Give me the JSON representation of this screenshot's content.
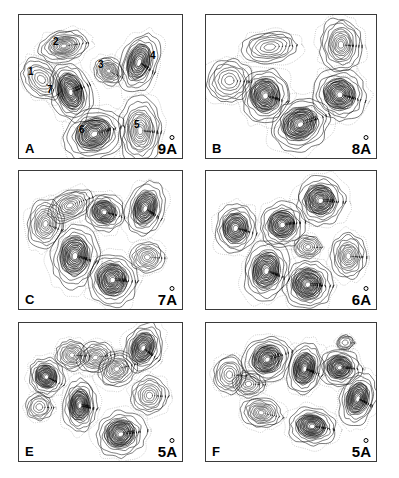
{
  "figure": {
    "background_color": "#ffffff",
    "contour_color": "#000000",
    "panel_border_color": "#3a3a3a"
  },
  "panels": [
    {
      "id": "A",
      "letter": "A",
      "resolution": "9",
      "unit": "A",
      "feature_labels": [
        {
          "text": "1",
          "x": 9,
          "y": 52
        },
        {
          "text": "2",
          "x": 34,
          "y": 22
        },
        {
          "text": "3",
          "x": 79,
          "y": 45
        },
        {
          "text": "4",
          "x": 131,
          "y": 36
        },
        {
          "text": "5",
          "x": 115,
          "y": 105
        },
        {
          "text": "6",
          "x": 60,
          "y": 110
        },
        {
          "text": "7",
          "x": 28,
          "y": 70
        }
      ]
    },
    {
      "id": "B",
      "letter": "B",
      "resolution": "8",
      "unit": "A",
      "feature_labels": []
    },
    {
      "id": "C",
      "letter": "C",
      "resolution": "7",
      "unit": "A",
      "feature_labels": []
    },
    {
      "id": "D",
      "letter": "",
      "resolution": "6",
      "unit": "A",
      "feature_labels": []
    },
    {
      "id": "E",
      "letter": "E",
      "resolution": "5",
      "unit": "A",
      "feature_labels": []
    },
    {
      "id": "F",
      "letter": "F",
      "resolution": "5",
      "unit": "A",
      "feature_labels": []
    }
  ],
  "chart_data": {
    "type": "contour",
    "title": "",
    "xlabel": "",
    "ylabel": "",
    "grid": false,
    "legend": "none",
    "series": [
      {
        "name": "A",
        "resolution_angstrom": 9,
        "peaks": [
          {
            "label": "1",
            "cx": 22,
            "cy": 54,
            "rx": 13,
            "ry": 9,
            "rot": 35,
            "levels": 4,
            "intensity": "low"
          },
          {
            "label": "2",
            "cx": 44,
            "cy": 26,
            "rx": 15,
            "ry": 8,
            "rot": -8,
            "levels": 9,
            "intensity": "medium"
          },
          {
            "label": "3",
            "cx": 88,
            "cy": 47,
            "rx": 9,
            "ry": 7,
            "rot": 20,
            "levels": 7,
            "intensity": "medium"
          },
          {
            "label": "4",
            "cx": 118,
            "cy": 40,
            "rx": 11,
            "ry": 16,
            "rot": 25,
            "levels": 8,
            "intensity": "high"
          },
          {
            "label": "5",
            "cx": 119,
            "cy": 97,
            "rx": 13,
            "ry": 17,
            "rot": 0,
            "levels": 9,
            "intensity": "medium"
          },
          {
            "label": "6",
            "cx": 74,
            "cy": 100,
            "rx": 18,
            "ry": 13,
            "rot": -15,
            "levels": 10,
            "intensity": "high"
          },
          {
            "label": "7",
            "cx": 51,
            "cy": 65,
            "rx": 12,
            "ry": 16,
            "rot": -25,
            "levels": 11,
            "intensity": "very-high"
          }
        ]
      },
      {
        "name": "B",
        "resolution_angstrom": 8,
        "peaks": [
          {
            "cx": 22,
            "cy": 55,
            "rx": 13,
            "ry": 11,
            "rot": 0,
            "levels": 4,
            "intensity": "low"
          },
          {
            "cx": 60,
            "cy": 27,
            "rx": 16,
            "ry": 8,
            "rot": -5,
            "levels": 4,
            "intensity": "low"
          },
          {
            "cx": 56,
            "cy": 68,
            "rx": 14,
            "ry": 14,
            "rot": 10,
            "levels": 10,
            "intensity": "high"
          },
          {
            "cx": 89,
            "cy": 92,
            "rx": 17,
            "ry": 13,
            "rot": -20,
            "levels": 11,
            "intensity": "very-high"
          },
          {
            "cx": 127,
            "cy": 25,
            "rx": 12,
            "ry": 14,
            "rot": 0,
            "levels": 8,
            "intensity": "medium"
          },
          {
            "cx": 126,
            "cy": 67,
            "rx": 15,
            "ry": 13,
            "rot": 10,
            "levels": 10,
            "intensity": "high"
          }
        ]
      },
      {
        "name": "C",
        "resolution_angstrom": 7,
        "peaks": [
          {
            "cx": 26,
            "cy": 46,
            "rx": 11,
            "ry": 13,
            "rot": 15,
            "levels": 7,
            "intensity": "medium"
          },
          {
            "cx": 50,
            "cy": 30,
            "rx": 14,
            "ry": 8,
            "rot": -20,
            "levels": 6,
            "intensity": "medium"
          },
          {
            "cx": 84,
            "cy": 36,
            "rx": 12,
            "ry": 10,
            "rot": 10,
            "levels": 8,
            "intensity": "high"
          },
          {
            "cx": 124,
            "cy": 33,
            "rx": 11,
            "ry": 15,
            "rot": 25,
            "levels": 9,
            "intensity": "high"
          },
          {
            "cx": 55,
            "cy": 74,
            "rx": 14,
            "ry": 17,
            "rot": 10,
            "levels": 10,
            "intensity": "high"
          },
          {
            "cx": 92,
            "cy": 95,
            "rx": 15,
            "ry": 14,
            "rot": 0,
            "levels": 11,
            "intensity": "very-high"
          },
          {
            "cx": 126,
            "cy": 75,
            "rx": 10,
            "ry": 8,
            "rot": 0,
            "levels": 5,
            "intensity": "low"
          }
        ]
      },
      {
        "name": "D",
        "resolution_angstrom": 6,
        "peaks": [
          {
            "cx": 28,
            "cy": 50,
            "rx": 12,
            "ry": 13,
            "rot": 10,
            "levels": 8,
            "intensity": "high"
          },
          {
            "cx": 72,
            "cy": 47,
            "rx": 13,
            "ry": 12,
            "rot": -10,
            "levels": 9,
            "intensity": "high"
          },
          {
            "cx": 108,
            "cy": 26,
            "rx": 14,
            "ry": 13,
            "rot": 0,
            "levels": 10,
            "intensity": "very-high"
          },
          {
            "cx": 96,
            "cy": 66,
            "rx": 8,
            "ry": 6,
            "rot": 0,
            "levels": 4,
            "intensity": "low"
          },
          {
            "cx": 134,
            "cy": 74,
            "rx": 10,
            "ry": 12,
            "rot": 0,
            "levels": 7,
            "intensity": "medium"
          },
          {
            "cx": 57,
            "cy": 87,
            "rx": 13,
            "ry": 16,
            "rot": 15,
            "levels": 10,
            "intensity": "high"
          },
          {
            "cx": 96,
            "cy": 99,
            "rx": 14,
            "ry": 13,
            "rot": 0,
            "levels": 11,
            "intensity": "very-high"
          }
        ]
      },
      {
        "name": "E",
        "resolution_angstrom": 5,
        "peaks": [
          {
            "cx": 27,
            "cy": 47,
            "rx": 11,
            "ry": 10,
            "rot": 20,
            "levels": 9,
            "intensity": "high"
          },
          {
            "cx": 52,
            "cy": 28,
            "rx": 10,
            "ry": 8,
            "rot": 0,
            "levels": 6,
            "intensity": "medium"
          },
          {
            "cx": 75,
            "cy": 30,
            "rx": 11,
            "ry": 8,
            "rot": -10,
            "levels": 6,
            "intensity": "medium"
          },
          {
            "cx": 96,
            "cy": 40,
            "rx": 12,
            "ry": 9,
            "rot": -15,
            "levels": 7,
            "intensity": "medium"
          },
          {
            "cx": 122,
            "cy": 22,
            "rx": 11,
            "ry": 14,
            "rot": 30,
            "levels": 9,
            "intensity": "high"
          },
          {
            "cx": 128,
            "cy": 63,
            "rx": 11,
            "ry": 10,
            "rot": 0,
            "levels": 5,
            "intensity": "low"
          },
          {
            "cx": 60,
            "cy": 72,
            "rx": 10,
            "ry": 14,
            "rot": 5,
            "levels": 10,
            "intensity": "very-high"
          },
          {
            "cx": 100,
            "cy": 97,
            "rx": 15,
            "ry": 12,
            "rot": -10,
            "levels": 10,
            "intensity": "very-high"
          },
          {
            "cx": 20,
            "cy": 73,
            "rx": 8,
            "ry": 7,
            "rot": 0,
            "levels": 3,
            "intensity": "low"
          }
        ]
      },
      {
        "name": "F",
        "resolution_angstrom": 5,
        "peaks": [
          {
            "cx": 22,
            "cy": 45,
            "rx": 9,
            "ry": 10,
            "rot": 0,
            "levels": 4,
            "intensity": "low"
          },
          {
            "cx": 40,
            "cy": 53,
            "rx": 9,
            "ry": 7,
            "rot": 0,
            "levels": 4,
            "intensity": "low"
          },
          {
            "cx": 58,
            "cy": 32,
            "rx": 14,
            "ry": 12,
            "rot": -20,
            "levels": 10,
            "intensity": "very-high"
          },
          {
            "cx": 93,
            "cy": 40,
            "rx": 10,
            "ry": 14,
            "rot": 15,
            "levels": 10,
            "intensity": "high"
          },
          {
            "cx": 126,
            "cy": 39,
            "rx": 12,
            "ry": 10,
            "rot": 0,
            "levels": 9,
            "intensity": "very-high"
          },
          {
            "cx": 131,
            "cy": 17,
            "rx": 5,
            "ry": 4,
            "rot": 0,
            "levels": 2,
            "intensity": "low"
          },
          {
            "cx": 52,
            "cy": 78,
            "rx": 12,
            "ry": 8,
            "rot": 10,
            "levels": 7,
            "intensity": "medium"
          },
          {
            "cx": 100,
            "cy": 90,
            "rx": 14,
            "ry": 10,
            "rot": 5,
            "levels": 9,
            "intensity": "high"
          },
          {
            "cx": 143,
            "cy": 66,
            "rx": 10,
            "ry": 14,
            "rot": 20,
            "levels": 9,
            "intensity": "high"
          }
        ]
      }
    ]
  }
}
